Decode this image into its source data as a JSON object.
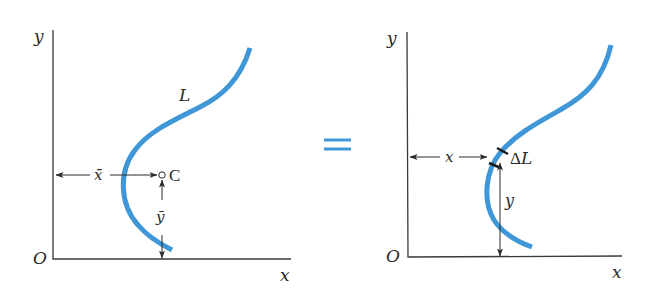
{
  "figure": {
    "colors": {
      "curve": "#3f97d8",
      "equals_sign": "#3f97d8",
      "ink": "#2a2a2a"
    }
  },
  "left_panel": {
    "axis_y_label": "y",
    "axis_x_label": "x",
    "origin_label": "O",
    "curve_label": "L",
    "centroid_label": "C",
    "xbar_label": "x̄",
    "ybar_label": "ȳ"
  },
  "equals": {
    "symbol": "="
  },
  "right_panel": {
    "axis_y_label": "y",
    "axis_x_label": "x",
    "origin_label": "O",
    "element_label": "ΔL",
    "x_dim_label": "x",
    "y_dim_label": "y"
  }
}
